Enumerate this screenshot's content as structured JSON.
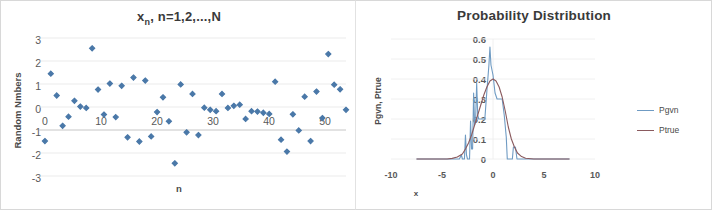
{
  "figure": {
    "background": "#ffffff",
    "border_color": "#d8d8d8"
  },
  "chart_data": [
    {
      "type": "scatter",
      "panel": "left",
      "title": "x",
      "title_sub": "n",
      "title_rest": ", n=1,2,...,N",
      "title_full": "xn, n=1,2,...,N",
      "xlabel": "n",
      "ylabel": "Random Nmbers",
      "xlim": [
        0,
        52
      ],
      "ylim": [
        -3,
        3
      ],
      "xticks": [
        0,
        10,
        20,
        30,
        40,
        50
      ],
      "yticks": [
        3,
        2,
        1,
        0,
        -1,
        -2,
        -3
      ],
      "grid": true,
      "marker": "diamond",
      "marker_color": "#4a78a8",
      "series": [
        {
          "name": "xn",
          "points": [
            [
              1,
              -1.48
            ],
            [
              2,
              1.45
            ],
            [
              3,
              0.5
            ],
            [
              4,
              -0.82
            ],
            [
              5,
              -0.42
            ],
            [
              6,
              0.27
            ],
            [
              7,
              0.02
            ],
            [
              8,
              -0.04
            ],
            [
              9,
              2.55
            ],
            [
              10,
              0.76
            ],
            [
              11,
              -0.33
            ],
            [
              12,
              1.02
            ],
            [
              13,
              -0.44
            ],
            [
              14,
              0.92
            ],
            [
              15,
              -1.32
            ],
            [
              16,
              1.28
            ],
            [
              17,
              -1.5
            ],
            [
              18,
              1.15
            ],
            [
              19,
              -1.28
            ],
            [
              20,
              -0.22
            ],
            [
              21,
              0.42
            ],
            [
              22,
              -0.62
            ],
            [
              23,
              -2.45
            ],
            [
              24,
              0.98
            ],
            [
              25,
              -1.1
            ],
            [
              26,
              0.57
            ],
            [
              27,
              -1.22
            ],
            [
              28,
              -0.03
            ],
            [
              29,
              -0.12
            ],
            [
              30,
              -0.18
            ],
            [
              31,
              0.57
            ],
            [
              32,
              -0.04
            ],
            [
              33,
              0.05
            ],
            [
              34,
              0.1
            ],
            [
              35,
              -0.52
            ],
            [
              36,
              -0.18
            ],
            [
              37,
              -0.2
            ],
            [
              38,
              -0.25
            ],
            [
              39,
              -0.3
            ],
            [
              40,
              1.1
            ],
            [
              41,
              -1.42
            ],
            [
              42,
              -1.94
            ],
            [
              43,
              -0.32
            ],
            [
              44,
              -1.02
            ],
            [
              45,
              0.45
            ],
            [
              46,
              -1.48
            ],
            [
              47,
              0.67
            ],
            [
              48,
              -0.48
            ],
            [
              49,
              2.3
            ],
            [
              50,
              0.97
            ],
            [
              51,
              0.77
            ],
            [
              52,
              -0.12
            ]
          ]
        }
      ]
    },
    {
      "type": "line",
      "panel": "right",
      "title": "Probability Distribution",
      "xlabel": "x",
      "ylabel": "Pgvn, Ptrue",
      "xlim": [
        -10,
        10
      ],
      "ylim": [
        0,
        0.6
      ],
      "xticks": [
        -10,
        -5,
        0,
        5,
        10
      ],
      "yticks": [
        0.6,
        0.5,
        0.4,
        0.3,
        0.2,
        0.1,
        0
      ],
      "ytick_labels": [
        "0.6",
        "0.5",
        "0.4",
        "0.3",
        "0.2",
        "0.1",
        "0"
      ],
      "grid": true,
      "legend_position": "right",
      "series": [
        {
          "name": "Pgvn",
          "color": "#6f9bc3",
          "points": [
            [
              -7.5,
              0.0
            ],
            [
              -4.0,
              0.0
            ],
            [
              -3.3,
              0.0
            ],
            [
              -3.1,
              0.02
            ],
            [
              -3.0,
              0.0
            ],
            [
              -2.8,
              0.0
            ],
            [
              -2.7,
              0.12
            ],
            [
              -2.6,
              0.02
            ],
            [
              -2.5,
              0.0
            ],
            [
              -2.3,
              0.0
            ],
            [
              -2.2,
              0.19
            ],
            [
              -2.1,
              0.05
            ],
            [
              -2.0,
              0.05
            ],
            [
              -1.9,
              0.33
            ],
            [
              -1.8,
              0.17
            ],
            [
              -1.7,
              0.2
            ],
            [
              -1.6,
              0.38
            ],
            [
              -1.5,
              0.22
            ],
            [
              -1.4,
              0.2
            ],
            [
              -1.2,
              0.2
            ],
            [
              -1.0,
              0.2
            ],
            [
              -0.8,
              0.2
            ],
            [
              -0.6,
              0.34
            ],
            [
              -0.4,
              0.47
            ],
            [
              -0.3,
              0.56
            ],
            [
              -0.2,
              0.47
            ],
            [
              0.0,
              0.42
            ],
            [
              0.2,
              0.33
            ],
            [
              0.4,
              0.3
            ],
            [
              0.7,
              0.3
            ],
            [
              0.9,
              0.3
            ],
            [
              1.1,
              0.22
            ],
            [
              1.3,
              0.11
            ],
            [
              1.4,
              0.0
            ],
            [
              1.7,
              0.0
            ],
            [
              1.9,
              0.0
            ],
            [
              2.0,
              0.06
            ],
            [
              2.2,
              0.06
            ],
            [
              2.35,
              0.0
            ],
            [
              2.6,
              0.0
            ],
            [
              3.2,
              0.0
            ],
            [
              7.5,
              0.0
            ]
          ]
        },
        {
          "name": "Ptrue",
          "color": "#8a5a5e",
          "points": [
            [
              -7.5,
              0.0
            ],
            [
              -4.5,
              0.0
            ],
            [
              -4.0,
              0.003
            ],
            [
              -3.5,
              0.01
            ],
            [
              -3.0,
              0.025
            ],
            [
              -2.7,
              0.05
            ],
            [
              -2.4,
              0.08
            ],
            [
              -2.1,
              0.12
            ],
            [
              -1.8,
              0.17
            ],
            [
              -1.5,
              0.22
            ],
            [
              -1.2,
              0.27
            ],
            [
              -0.9,
              0.32
            ],
            [
              -0.6,
              0.36
            ],
            [
              -0.3,
              0.39
            ],
            [
              0.0,
              0.4
            ],
            [
              0.3,
              0.39
            ],
            [
              0.6,
              0.36
            ],
            [
              0.9,
              0.31
            ],
            [
              1.2,
              0.24
            ],
            [
              1.5,
              0.16
            ],
            [
              1.8,
              0.1
            ],
            [
              2.1,
              0.06
            ],
            [
              2.4,
              0.03
            ],
            [
              2.8,
              0.012
            ],
            [
              3.2,
              0.004
            ],
            [
              4.0,
              0.0
            ],
            [
              7.5,
              0.0
            ]
          ]
        }
      ]
    }
  ]
}
